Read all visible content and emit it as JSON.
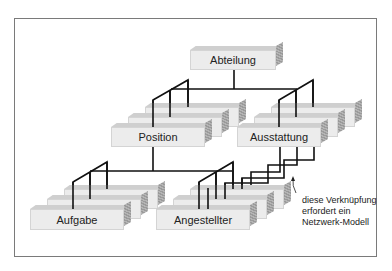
{
  "diagram": {
    "type": "hierarchical-data-model",
    "nodes": {
      "root": "Abteilung",
      "level1": [
        "Position",
        "Ausstattung"
      ],
      "level2": [
        "Aufgabe",
        "Angestellter"
      ]
    },
    "edges": [
      {
        "from": "Abteilung",
        "to": "Position"
      },
      {
        "from": "Abteilung",
        "to": "Ausstattung"
      },
      {
        "from": "Position",
        "to": "Aufgabe"
      },
      {
        "from": "Position",
        "to": "Angestellter"
      },
      {
        "from": "Ausstattung",
        "to": "Angestellter",
        "note": "network"
      }
    ],
    "annotation": {
      "line1": "diese Verknüpfung",
      "line2": "erfordert ein",
      "line3": "Netzwerk-Modell"
    }
  },
  "colors": {
    "box_face": "#ececec",
    "box_top": "#cfcfcf",
    "box_side": "#a8a8a8",
    "line": "#111111",
    "frame": "#7a7a7a"
  }
}
